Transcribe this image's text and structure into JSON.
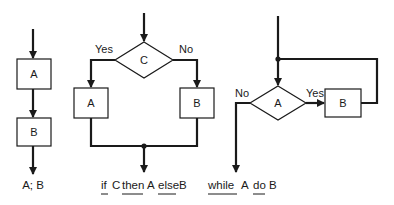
{
  "diagrams": {
    "sequence": {
      "box_a": "A",
      "box_b": "B",
      "caption": "A; B"
    },
    "if_then_else": {
      "condition": "C",
      "yes_label": "Yes",
      "no_label": "No",
      "box_a": "A",
      "box_b": "B",
      "caption": {
        "kw_if": "if",
        "c": "C",
        "kw_then": "then",
        "a": "A",
        "kw_else": "else",
        "b": "B"
      }
    },
    "while_do": {
      "condition": "A",
      "yes_label": "Yes",
      "no_label": "No",
      "box_b": "B",
      "caption": {
        "kw_while": "while",
        "a": "A",
        "kw_do": "do",
        "b": "B"
      }
    }
  }
}
